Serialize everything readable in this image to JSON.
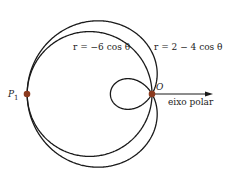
{
  "diagram": {
    "origin_px": [
      152,
      94
    ],
    "scale_px_per_unit": 20.8,
    "curves": [
      {
        "name": "circle",
        "equation": "r = −6 cos θ",
        "a": 0,
        "b": -6,
        "label": "r = −6 cos θ",
        "label_pos": [
          73,
          50
        ]
      },
      {
        "name": "limacon",
        "equation": "r = 2 − 4 cos θ",
        "a": 2,
        "b": -4,
        "label": "r = 2 − 4 cos θ",
        "label_pos": [
          154,
          50
        ]
      }
    ],
    "points": [
      {
        "name": "P1",
        "label": "P",
        "subscript": "1",
        "color": "#8b3a1e",
        "pos": [
          27,
          94
        ]
      },
      {
        "name": "O",
        "label": "O",
        "color": "#8b3a1e",
        "pos": [
          152,
          94
        ]
      }
    ],
    "polar_axis": {
      "label": "eixo polar",
      "end_x": 213
    },
    "colors": {
      "curve": "#1a1a1a",
      "point": "#8b3a1e"
    }
  }
}
